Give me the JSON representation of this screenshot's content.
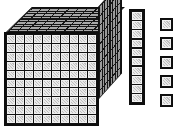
{
  "figure": {
    "kind": "base-ten-blocks",
    "background_color": "#ffffff",
    "outline_color": "#101010",
    "face_fill_color": "#cfcfcf",
    "top_face_color": "#a8a8a8",
    "side_face_color": "#9a9a9a"
  },
  "groups": [
    {
      "name": "thousand-cube",
      "label": "large cube",
      "place_value": "thousands",
      "count": 1,
      "unit_value": 1000,
      "front_face_columns": 10,
      "front_face_rows": 10,
      "front_face_units": 100,
      "depth_units": 10,
      "total_units": 1000
    },
    {
      "name": "ten-rod",
      "label": "rod",
      "place_value": "tens",
      "count": 1,
      "unit_value": 10,
      "units_in_rod": 10,
      "total_units": 10
    },
    {
      "name": "unit-cubes",
      "label": "unit cubes",
      "place_value": "ones",
      "count": 5,
      "unit_value": 1,
      "total_units": 5
    }
  ],
  "cube": {
    "front_cells": [
      [
        "c",
        "c",
        "c",
        "c",
        "c",
        "c",
        "c",
        "c",
        "c",
        "c"
      ],
      [
        "c",
        "c",
        "c",
        "c",
        "c",
        "c",
        "c",
        "c",
        "c",
        "c"
      ],
      [
        "c",
        "c",
        "c",
        "c",
        "c",
        "c",
        "c",
        "c",
        "c",
        "c"
      ],
      [
        "c",
        "c",
        "c",
        "c",
        "c",
        "c",
        "c",
        "c",
        "c",
        "c"
      ],
      [
        "c",
        "c",
        "c",
        "c",
        "c",
        "c",
        "c",
        "c",
        "c",
        "c"
      ],
      [
        "c",
        "c",
        "c",
        "c",
        "c",
        "c",
        "c",
        "c",
        "c",
        "c"
      ],
      [
        "c",
        "c",
        "c",
        "c",
        "c",
        "c",
        "c",
        "c",
        "c",
        "c"
      ],
      [
        "c",
        "c",
        "c",
        "c",
        "c",
        "c",
        "c",
        "c",
        "c",
        "c"
      ],
      [
        "c",
        "c",
        "c",
        "c",
        "c",
        "c",
        "c",
        "c",
        "c",
        "c"
      ],
      [
        "c",
        "c",
        "c",
        "c",
        "c",
        "c",
        "c",
        "c",
        "c",
        "c"
      ]
    ]
  },
  "rod": {
    "cells": [
      "u",
      "u",
      "u",
      "u",
      "u",
      "u",
      "u",
      "u",
      "u",
      "u"
    ]
  },
  "ones": {
    "cubes": [
      "u",
      "u",
      "u",
      "u",
      "u"
    ]
  },
  "totals": {
    "thousands": 1,
    "hundreds": 0,
    "tens": 1,
    "ones": 5,
    "value": 1015
  }
}
